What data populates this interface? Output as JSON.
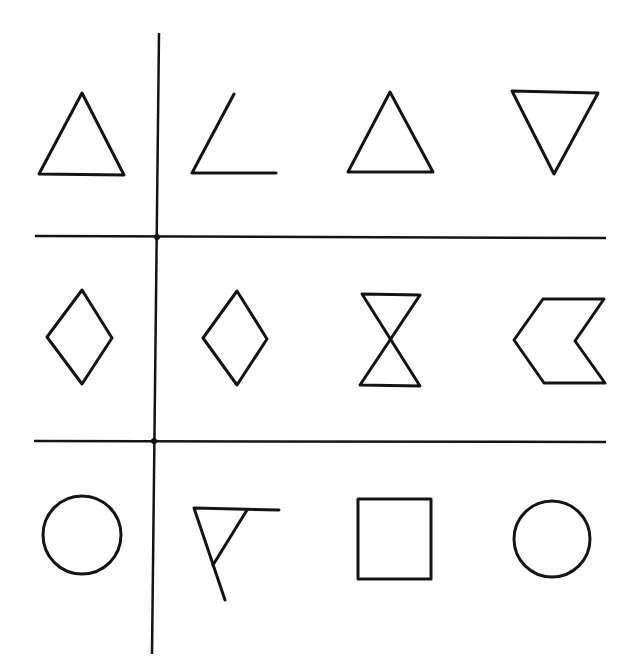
{
  "figure": {
    "width": 634,
    "height": 667,
    "background": "#ffffff",
    "ink_color": "#141414",
    "layout": "3 rows x 4 columns; first column separated from the other three by a vertical line; rows separated by two horizontal lines"
  },
  "grid_lines": [
    {
      "name": "vertical-divider",
      "x1": 159,
      "y1": 33,
      "x2": 152,
      "y2": 654
    },
    {
      "name": "horizontal-divider-top",
      "x1": 35,
      "y1": 236,
      "x2": 606,
      "y2": 238
    },
    {
      "name": "horizontal-divider-bottom",
      "x1": 34,
      "y1": 441,
      "x2": 606,
      "y2": 442
    }
  ],
  "junctions": [
    {
      "cx": 157,
      "cy": 237
    },
    {
      "cx": 154,
      "cy": 441
    }
  ],
  "rows": [
    {
      "index": 1,
      "shapes": [
        {
          "name": "upright-triangle",
          "kind": "polygon",
          "points": "82,93 39,174 124,175"
        },
        {
          "name": "open-angle",
          "kind": "polyline",
          "points": "234,94 192,173 276,173"
        },
        {
          "name": "upright-triangle",
          "kind": "polygon",
          "points": "390,92 348,172 433,172"
        },
        {
          "name": "inverted-triangle",
          "kind": "polygon",
          "points": "512,91 598,93 554,174"
        }
      ]
    },
    {
      "index": 2,
      "shapes": [
        {
          "name": "rhombus",
          "kind": "polygon",
          "points": "82,290 112,338 82,384 47,337"
        },
        {
          "name": "rhombus",
          "kind": "polygon",
          "points": "237,291 267,339 237,385 203,338"
        },
        {
          "name": "hourglass",
          "kind": "polygon",
          "points": "362,294 420,295 360,385 420,386"
        },
        {
          "name": "chevron-arrow-left",
          "kind": "polygon",
          "points": "543,299 604,299 575,341 605,383 544,383 514,340"
        }
      ]
    },
    {
      "index": 3,
      "shapes": [
        {
          "name": "circle",
          "kind": "circle",
          "cx": 82,
          "cy": 535,
          "r": 39
        },
        {
          "name": "open-triangle-with-extended-lines",
          "kind": "polyline",
          "points": "279,510 194,508 225,600",
          "extra": "247,510 213,565"
        },
        {
          "name": "square",
          "kind": "polygon",
          "points": "358,499 431,499 431,579 358,579"
        },
        {
          "name": "circle",
          "kind": "circle",
          "cx": 552,
          "cy": 539,
          "r": 38
        }
      ]
    }
  ]
}
